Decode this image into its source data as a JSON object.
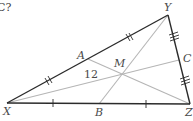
{
  "header": {
    "clipped_question_text": "C?"
  },
  "diagram": {
    "colors": {
      "triangle_edges": "#2b2b2b",
      "medians": "#b5b5b5",
      "labels": "#4a4a4a"
    },
    "vertices": {
      "X": {
        "label": "X",
        "x": 7,
        "y": 103
      },
      "Y": {
        "label": "Y",
        "x": 168,
        "y": 15
      },
      "Z": {
        "label": "Z",
        "x": 190,
        "y": 104
      }
    },
    "midpoints": {
      "A": {
        "label": "A",
        "on_side": "XY",
        "x": 88,
        "y": 59
      },
      "B": {
        "label": "B",
        "on_side": "XZ",
        "x": 99,
        "y": 104
      },
      "C": {
        "label": "C",
        "on_side": "YZ",
        "x": 179,
        "y": 60
      }
    },
    "centroid": {
      "label": "M",
      "x": 122,
      "y": 74
    },
    "segment_labels": [
      {
        "segment": "AM",
        "value": "12"
      }
    ],
    "tick_marks": [
      {
        "side": "XA",
        "ticks": 2
      },
      {
        "side": "AY",
        "ticks": 2
      },
      {
        "side": "XB",
        "ticks": 1
      },
      {
        "side": "BZ",
        "ticks": 1
      },
      {
        "side": "YC",
        "ticks": 3
      },
      {
        "side": "CZ",
        "ticks": 3
      }
    ],
    "medians": [
      "X-C",
      "Y-B",
      "Z-A"
    ]
  }
}
